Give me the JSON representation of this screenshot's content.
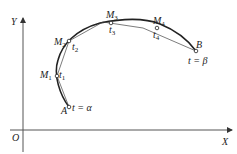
{
  "axes": {
    "origin_label": "O",
    "x_label": "X",
    "y_label": "Y"
  },
  "points": {
    "A": {
      "label": "A",
      "param": "t = α"
    },
    "M1": {
      "label": "M",
      "sub": "1",
      "param": "t",
      "param_sub": "1"
    },
    "M2": {
      "label": "M",
      "sub": "2",
      "param": "t",
      "param_sub": "2"
    },
    "M3": {
      "label": "M",
      "sub": "3",
      "param": "t",
      "param_sub": "3"
    },
    "M4": {
      "label": "M",
      "sub": "4",
      "param": "t",
      "param_sub": "4"
    },
    "B": {
      "label": "B",
      "param": "t = β"
    }
  },
  "colors": {
    "line": "#222222",
    "axis": "#555555"
  }
}
